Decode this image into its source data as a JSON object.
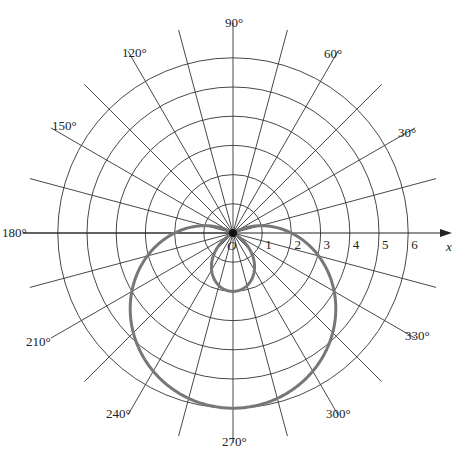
{
  "chart_data": {
    "type": "line",
    "subtype": "polar",
    "title": "",
    "equation": "r = 2 - 4 sin θ",
    "axis_label_x": "x",
    "origin_label": "O",
    "radial_ticks": [
      "1",
      "2",
      "3",
      "4",
      "5",
      "6"
    ],
    "radial_range": [
      0,
      6
    ],
    "angle_labels": [
      "30°",
      "60°",
      "90°",
      "120°",
      "150°",
      "180°",
      "210°",
      "240°",
      "270°",
      "300°",
      "330°"
    ],
    "angle_step_deg": 15,
    "grid": true,
    "curve_color": "#777777",
    "series": [
      {
        "name": "r = 2 - 4 sin θ",
        "theta_deg": [
          0,
          30,
          60,
          90,
          120,
          150,
          180,
          210,
          240,
          270,
          300,
          330,
          360
        ],
        "r": [
          2,
          0,
          -1.46,
          -2,
          -1.46,
          0,
          2,
          4,
          5.46,
          6,
          5.46,
          4,
          2
        ]
      }
    ]
  }
}
